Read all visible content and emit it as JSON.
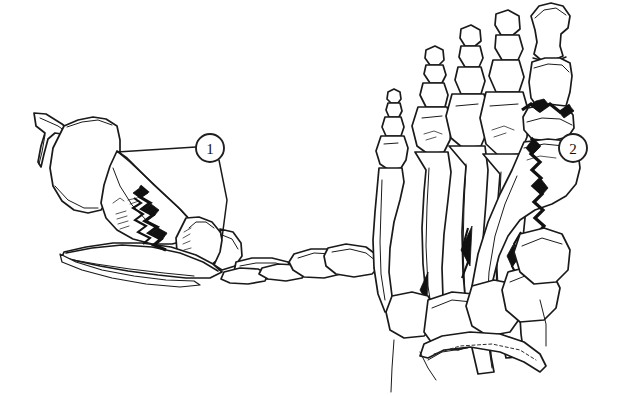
{
  "figure": {
    "title": "Foot skeleton fracture illustration",
    "background_color": "#ffffff",
    "ink_color": "#1a1a1a",
    "fracture_color": "#111111",
    "width": 623,
    "height": 396
  },
  "panels": [
    {
      "id": "lateral-view",
      "name": "Lateral view of foot and ankle",
      "position": "left",
      "description": "Side (lateral) view of the foot skeleton showing the distal tibia and fibula, talus, navicular, cuneiform, metatarsals and phalanges with a jagged fracture line."
    },
    {
      "id": "dorsal-view",
      "name": "Dorsal view of foot",
      "position": "right",
      "description": "Top (dorsal) view of the foot skeleton showing all five rays of phalanges and metatarsals, the tarsal bones and the calcaneus, with a jagged fracture at the first metatarsal head."
    }
  ],
  "callouts": [
    {
      "id": "callout-1",
      "label": "1",
      "cx": 210,
      "cy": 148,
      "r": 14,
      "target_panel": "lateral-view",
      "description": "Fracture line in lateral view"
    },
    {
      "id": "callout-2",
      "label": "2",
      "cx": 573,
      "cy": 148,
      "r": 14,
      "target_panel": "dorsal-view",
      "description": "Fracture line at first metatarsal in dorsal view"
    }
  ],
  "fractures": [
    {
      "id": "fracture-lateral",
      "panel": "lateral-view",
      "callout": "1",
      "style": "jagged-zigzag"
    },
    {
      "id": "fracture-dorsal-first-metatarsal",
      "panel": "dorsal-view",
      "callout": "2",
      "style": "jagged-zigzag"
    },
    {
      "id": "fracture-dorsal-fourth-metatarsal",
      "panel": "dorsal-view",
      "callout": "",
      "style": "jagged-sliver"
    }
  ]
}
